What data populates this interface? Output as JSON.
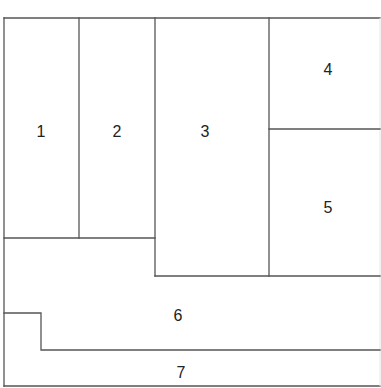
{
  "diagram": {
    "type": "floor-plan-partition",
    "regions": [
      {
        "id": "1",
        "label": "1"
      },
      {
        "id": "2",
        "label": "2"
      },
      {
        "id": "3",
        "label": "3"
      },
      {
        "id": "4",
        "label": "4"
      },
      {
        "id": "5",
        "label": "5"
      },
      {
        "id": "6",
        "label": "6"
      },
      {
        "id": "7",
        "label": "7"
      }
    ],
    "colors": {
      "line": "#555555",
      "text": "#222222",
      "background": "#ffffff"
    }
  }
}
